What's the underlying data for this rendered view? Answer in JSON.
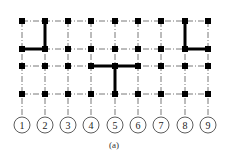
{
  "diagram": {
    "caption": "(a)",
    "axis_labels": [
      "1",
      "2",
      "3",
      "4",
      "5",
      "6",
      "7",
      "8",
      "9"
    ],
    "columns_x": [
      22,
      45,
      68,
      91,
      115,
      138,
      161,
      185,
      208
    ],
    "rows_y": [
      21,
      49,
      66,
      94
    ],
    "axis_circle_y": 125,
    "axis_circle_r": 8,
    "node_size": 6,
    "colors": {
      "line": "#000000",
      "node": "#000000",
      "grid": "#555555"
    },
    "heavy_segments": [
      {
        "from": [
          1,
          0
        ],
        "to": [
          1,
          1
        ]
      },
      {
        "from": [
          0,
          1
        ],
        "to": [
          1,
          1
        ]
      },
      {
        "from": [
          3,
          2
        ],
        "to": [
          5,
          2
        ]
      },
      {
        "from": [
          4,
          2
        ],
        "to": [
          4,
          3
        ]
      },
      {
        "from": [
          7,
          0
        ],
        "to": [
          7,
          1
        ]
      },
      {
        "from": [
          7,
          1
        ],
        "to": [
          8,
          1
        ]
      }
    ]
  }
}
